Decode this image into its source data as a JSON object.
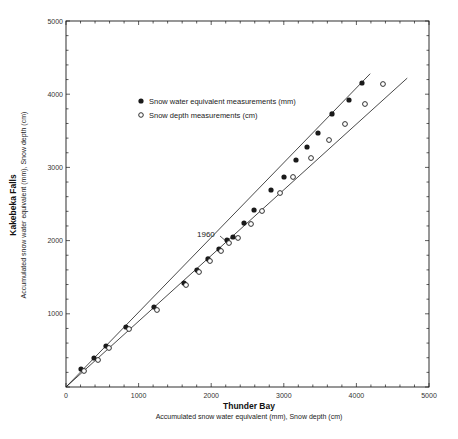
{
  "chart_data": {
    "type": "scatter",
    "title": "",
    "xlabel": "Thunder Bay",
    "xlabel_sub": "Accumulated snow water equivalent (mm), Snow depth (cm)",
    "ylabel": "Kakebeka Falls",
    "ylabel_sub": "Accumulated snow water equivalent (mm), Snow depth (cm)",
    "xlim": [
      0,
      5000
    ],
    "ylim": [
      0,
      5000
    ],
    "xticks": [
      0,
      1000,
      2000,
      3000,
      4000,
      5000
    ],
    "yticks": [
      1000,
      2000,
      3000,
      4000,
      5000
    ],
    "xtick_labels": [
      "0",
      "1000",
      "2000",
      "3000",
      "4000",
      "5000"
    ],
    "ytick_labels": [
      "1000",
      "2000",
      "3000",
      "4000",
      "5000"
    ],
    "minor_tick_step": 200,
    "grid": false,
    "legend_position": "upper-left inside plot",
    "annotations": [
      {
        "text": "1960",
        "x": 1960,
        "y": 2090
      }
    ],
    "series": [
      {
        "name": "Snow water equivalent measurements (mm)",
        "marker": "filled-circle",
        "x": [
          207,
          386,
          551,
          826,
          1212,
          1625,
          1804,
          1956,
          2107,
          2218,
          2300,
          2452,
          2590,
          2824,
          3003,
          3168,
          3320,
          3471,
          3664,
          3898,
          4077
        ],
        "y": [
          246,
          396,
          560,
          820,
          1093,
          1421,
          1598,
          1749,
          1885,
          2008,
          2049,
          2240,
          2418,
          2691,
          2869,
          3101,
          3279,
          3470,
          3730,
          3921,
          4153
        ],
        "fit_line": {
          "x": [
            0,
            4190
          ],
          "y": [
            0,
            4280
          ]
        }
      },
      {
        "name": "Snow depth measurements (cm)",
        "marker": "open-circle",
        "x": [
          248,
          441,
          592,
          868,
          1253,
          1653,
          1832,
          1983,
          2135,
          2245,
          2369,
          2548,
          2700,
          2948,
          3127,
          3375,
          3623,
          3843,
          4118,
          4366
        ],
        "y": [
          219,
          369,
          533,
          792,
          1052,
          1393,
          1571,
          1721,
          1858,
          1967,
          2036,
          2227,
          2404,
          2650,
          2869,
          3128,
          3374,
          3593,
          3866,
          4139
        ],
        "fit_line": {
          "x": [
            0,
            4700
          ],
          "y": [
            0,
            4220
          ]
        }
      }
    ]
  },
  "legend": {
    "items": [
      {
        "label": "Snow water equivalent measurements (mm)",
        "marker": "filled-circle"
      },
      {
        "label": "Snow depth measurements (cm)",
        "marker": "open-circle"
      }
    ]
  },
  "axes": {
    "x_title": "Thunder Bay",
    "x_subtitle": "Accumulated snow water equivalent (mm), Snow depth (cm)",
    "y_title": "Kakebeka Falls",
    "y_subtitle": "Accumulated snow water equivalent (mm), Snow depth (cm)"
  },
  "annotation_1960": "1960",
  "colors": {
    "ink": "#1a1a1a",
    "background": "#ffffff"
  }
}
